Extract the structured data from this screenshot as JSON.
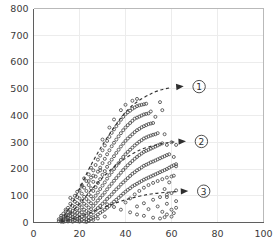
{
  "chart_data": {
    "type": "scatter",
    "title": "",
    "xlabel": "",
    "ylabel": "",
    "xlim": [
      0,
      100
    ],
    "ylim": [
      0,
      800
    ],
    "grid": true,
    "legend_position": "none",
    "xticks": [
      0,
      20,
      40,
      60,
      80,
      100
    ],
    "yticks": [
      0,
      100,
      200,
      300,
      400,
      500,
      600,
      700,
      800
    ],
    "xtick_labels": [
      "0",
      "20",
      "40",
      "60",
      "80",
      "100"
    ],
    "ytick_labels": [
      "0",
      "100",
      "200",
      "300",
      "400",
      "500",
      "600",
      "700",
      "800"
    ],
    "marker": "open-circle",
    "marker_color": "#4a4a4a",
    "points": [
      [
        11,
        5
      ],
      [
        11,
        12
      ],
      [
        12,
        3
      ],
      [
        12,
        8
      ],
      [
        12,
        18
      ],
      [
        12,
        25
      ],
      [
        13,
        2
      ],
      [
        13,
        10
      ],
      [
        13,
        15
      ],
      [
        13,
        22
      ],
      [
        13,
        33
      ],
      [
        14,
        5
      ],
      [
        14,
        12
      ],
      [
        14,
        20
      ],
      [
        14,
        28
      ],
      [
        14,
        42
      ],
      [
        15,
        4
      ],
      [
        15,
        9
      ],
      [
        15,
        17
      ],
      [
        15,
        26
      ],
      [
        15,
        38
      ],
      [
        15,
        55
      ],
      [
        16,
        6
      ],
      [
        16,
        14
      ],
      [
        16,
        24
      ],
      [
        16,
        35
      ],
      [
        16,
        48
      ],
      [
        16,
        70
      ],
      [
        17,
        3
      ],
      [
        17,
        11
      ],
      [
        17,
        21
      ],
      [
        17,
        30
      ],
      [
        17,
        44
      ],
      [
        17,
        62
      ],
      [
        17,
        85
      ],
      [
        18,
        8
      ],
      [
        18,
        16
      ],
      [
        18,
        27
      ],
      [
        18,
        40
      ],
      [
        18,
        58
      ],
      [
        18,
        78
      ],
      [
        18,
        100
      ],
      [
        19,
        5
      ],
      [
        19,
        13
      ],
      [
        19,
        23
      ],
      [
        19,
        36
      ],
      [
        19,
        52
      ],
      [
        19,
        72
      ],
      [
        19,
        95
      ],
      [
        20,
        7
      ],
      [
        20,
        18
      ],
      [
        20,
        31
      ],
      [
        20,
        46
      ],
      [
        20,
        66
      ],
      [
        20,
        90
      ],
      [
        20,
        120
      ],
      [
        21,
        10
      ],
      [
        21,
        22
      ],
      [
        21,
        38
      ],
      [
        21,
        57
      ],
      [
        21,
        80
      ],
      [
        21,
        108
      ],
      [
        21,
        140
      ],
      [
        22,
        4
      ],
      [
        22,
        15
      ],
      [
        22,
        29
      ],
      [
        22,
        48
      ],
      [
        22,
        70
      ],
      [
        22,
        96
      ],
      [
        22,
        130
      ],
      [
        22,
        165
      ],
      [
        23,
        12
      ],
      [
        23,
        26
      ],
      [
        23,
        43
      ],
      [
        23,
        64
      ],
      [
        23,
        88
      ],
      [
        23,
        118
      ],
      [
        23,
        155
      ],
      [
        24,
        9
      ],
      [
        24,
        20
      ],
      [
        24,
        36
      ],
      [
        24,
        56
      ],
      [
        24,
        79
      ],
      [
        24,
        105
      ],
      [
        24,
        140
      ],
      [
        24,
        180
      ],
      [
        25,
        14
      ],
      [
        25,
        30
      ],
      [
        25,
        50
      ],
      [
        25,
        72
      ],
      [
        25,
        98
      ],
      [
        25,
        128
      ],
      [
        25,
        168
      ],
      [
        25,
        205
      ],
      [
        26,
        18
      ],
      [
        26,
        38
      ],
      [
        26,
        62
      ],
      [
        26,
        88
      ],
      [
        26,
        118
      ],
      [
        26,
        152
      ],
      [
        26,
        195
      ],
      [
        27,
        24
      ],
      [
        27,
        46
      ],
      [
        27,
        72
      ],
      [
        27,
        100
      ],
      [
        27,
        132
      ],
      [
        27,
        172
      ],
      [
        27,
        215
      ],
      [
        28,
        30
      ],
      [
        28,
        54
      ],
      [
        28,
        82
      ],
      [
        28,
        112
      ],
      [
        28,
        148
      ],
      [
        28,
        190
      ],
      [
        28,
        235
      ],
      [
        29,
        36
      ],
      [
        29,
        62
      ],
      [
        29,
        92
      ],
      [
        29,
        125
      ],
      [
        29,
        162
      ],
      [
        29,
        205
      ],
      [
        29,
        250
      ],
      [
        30,
        42
      ],
      [
        30,
        70
      ],
      [
        30,
        102
      ],
      [
        30,
        138
      ],
      [
        30,
        178
      ],
      [
        30,
        222
      ],
      [
        30,
        270
      ],
      [
        30,
        310
      ],
      [
        31,
        48
      ],
      [
        31,
        78
      ],
      [
        31,
        112
      ],
      [
        31,
        150
      ],
      [
        31,
        192
      ],
      [
        31,
        238
      ],
      [
        31,
        288
      ],
      [
        32,
        55
      ],
      [
        32,
        88
      ],
      [
        32,
        124
      ],
      [
        32,
        164
      ],
      [
        32,
        208
      ],
      [
        32,
        255
      ],
      [
        32,
        305
      ],
      [
        33,
        62
      ],
      [
        33,
        96
      ],
      [
        33,
        135
      ],
      [
        33,
        177
      ],
      [
        33,
        222
      ],
      [
        33,
        270
      ],
      [
        33,
        320
      ],
      [
        33,
        355
      ],
      [
        34,
        70
      ],
      [
        34,
        105
      ],
      [
        34,
        145
      ],
      [
        34,
        188
      ],
      [
        34,
        235
      ],
      [
        34,
        285
      ],
      [
        34,
        335
      ],
      [
        35,
        78
      ],
      [
        35,
        115
      ],
      [
        35,
        156
      ],
      [
        35,
        200
      ],
      [
        35,
        248
      ],
      [
        35,
        298
      ],
      [
        35,
        348
      ],
      [
        35,
        385
      ],
      [
        36,
        85
      ],
      [
        36,
        124
      ],
      [
        36,
        166
      ],
      [
        36,
        212
      ],
      [
        36,
        260
      ],
      [
        36,
        310
      ],
      [
        36,
        360
      ],
      [
        37,
        92
      ],
      [
        37,
        132
      ],
      [
        37,
        176
      ],
      [
        37,
        222
      ],
      [
        37,
        272
      ],
      [
        37,
        322
      ],
      [
        37,
        372
      ],
      [
        38,
        100
      ],
      [
        38,
        142
      ],
      [
        38,
        186
      ],
      [
        38,
        234
      ],
      [
        38,
        284
      ],
      [
        38,
        334
      ],
      [
        38,
        384
      ],
      [
        38,
        420
      ],
      [
        39,
        108
      ],
      [
        39,
        150
      ],
      [
        39,
        196
      ],
      [
        39,
        245
      ],
      [
        39,
        295
      ],
      [
        39,
        345
      ],
      [
        39,
        395
      ],
      [
        40,
        115
      ],
      [
        40,
        158
      ],
      [
        40,
        205
      ],
      [
        40,
        255
      ],
      [
        40,
        305
      ],
      [
        40,
        355
      ],
      [
        40,
        405
      ],
      [
        40,
        440
      ],
      [
        41,
        122
      ],
      [
        41,
        166
      ],
      [
        41,
        214
      ],
      [
        41,
        264
      ],
      [
        41,
        314
      ],
      [
        41,
        364
      ],
      [
        41,
        412
      ],
      [
        42,
        128
      ],
      [
        42,
        174
      ],
      [
        42,
        222
      ],
      [
        42,
        272
      ],
      [
        42,
        322
      ],
      [
        42,
        372
      ],
      [
        42,
        418
      ],
      [
        43,
        135
      ],
      [
        43,
        182
      ],
      [
        43,
        230
      ],
      [
        43,
        280
      ],
      [
        43,
        330
      ],
      [
        43,
        380
      ],
      [
        43,
        425
      ],
      [
        43,
        455
      ],
      [
        44,
        140
      ],
      [
        44,
        188
      ],
      [
        44,
        238
      ],
      [
        44,
        288
      ],
      [
        44,
        338
      ],
      [
        44,
        388
      ],
      [
        44,
        430
      ],
      [
        45,
        145
      ],
      [
        45,
        195
      ],
      [
        45,
        245
      ],
      [
        45,
        295
      ],
      [
        45,
        345
      ],
      [
        45,
        392
      ],
      [
        45,
        435
      ],
      [
        45,
        462
      ],
      [
        46,
        150
      ],
      [
        46,
        200
      ],
      [
        46,
        252
      ],
      [
        46,
        302
      ],
      [
        46,
        350
      ],
      [
        46,
        396
      ],
      [
        46,
        438
      ],
      [
        47,
        155
      ],
      [
        47,
        206
      ],
      [
        47,
        258
      ],
      [
        47,
        308
      ],
      [
        47,
        356
      ],
      [
        47,
        400
      ],
      [
        47,
        440
      ],
      [
        48,
        160
      ],
      [
        48,
        212
      ],
      [
        48,
        264
      ],
      [
        48,
        314
      ],
      [
        48,
        360
      ],
      [
        48,
        404
      ],
      [
        48,
        442
      ],
      [
        49,
        164
      ],
      [
        49,
        216
      ],
      [
        49,
        268
      ],
      [
        49,
        318
      ],
      [
        49,
        364
      ],
      [
        49,
        406
      ],
      [
        49,
        444
      ],
      [
        50,
        168
      ],
      [
        50,
        220
      ],
      [
        50,
        272
      ],
      [
        50,
        322
      ],
      [
        50,
        368
      ],
      [
        50,
        408
      ],
      [
        51,
        172
      ],
      [
        51,
        225
      ],
      [
        51,
        276
      ],
      [
        51,
        325
      ],
      [
        51,
        370
      ],
      [
        52,
        176
      ],
      [
        52,
        228
      ],
      [
        52,
        280
      ],
      [
        52,
        328
      ],
      [
        52,
        372
      ],
      [
        53,
        180
      ],
      [
        53,
        232
      ],
      [
        53,
        284
      ],
      [
        53,
        330
      ],
      [
        54,
        184
      ],
      [
        54,
        236
      ],
      [
        54,
        288
      ],
      [
        54,
        334
      ],
      [
        55,
        188
      ],
      [
        55,
        240
      ],
      [
        55,
        292
      ],
      [
        56,
        192
      ],
      [
        56,
        244
      ],
      [
        56,
        296
      ],
      [
        57,
        196
      ],
      [
        57,
        248
      ],
      [
        58,
        200
      ],
      [
        58,
        252
      ],
      [
        59,
        205
      ],
      [
        60,
        210
      ],
      [
        61,
        214
      ],
      [
        62,
        218
      ],
      [
        40,
        75
      ],
      [
        42,
        90
      ],
      [
        44,
        105
      ],
      [
        46,
        118
      ],
      [
        48,
        130
      ],
      [
        50,
        140
      ],
      [
        52,
        148
      ],
      [
        54,
        155
      ],
      [
        56,
        162
      ],
      [
        58,
        168
      ],
      [
        60,
        172
      ],
      [
        45,
        60
      ],
      [
        48,
        72
      ],
      [
        52,
        85
      ],
      [
        55,
        95
      ],
      [
        58,
        104
      ],
      [
        50,
        50
      ],
      [
        54,
        60
      ],
      [
        58,
        70
      ],
      [
        62,
        80
      ],
      [
        56,
        40
      ],
      [
        60,
        48
      ],
      [
        62,
        55
      ],
      [
        58,
        30
      ],
      [
        61,
        35
      ],
      [
        57,
        20
      ],
      [
        60,
        22
      ],
      [
        55,
        15
      ],
      [
        52,
        18
      ],
      [
        48,
        25
      ],
      [
        45,
        30
      ],
      [
        42,
        38
      ],
      [
        38,
        48
      ],
      [
        35,
        58
      ],
      [
        32,
        68
      ],
      [
        28,
        15
      ],
      [
        31,
        22
      ],
      [
        26,
        10
      ],
      [
        24,
        6
      ],
      [
        20,
        3
      ],
      [
        23,
        2
      ],
      [
        14,
        48
      ],
      [
        16,
        92
      ],
      [
        19,
        115
      ],
      [
        21,
        135
      ],
      [
        24,
        155
      ],
      [
        26,
        175
      ],
      [
        29,
        195
      ],
      [
        57,
        330
      ],
      [
        58,
        290
      ],
      [
        59,
        255
      ],
      [
        60,
        300
      ],
      [
        61,
        245
      ],
      [
        56,
        420
      ],
      [
        55,
        450
      ],
      [
        53,
        395
      ],
      [
        51,
        415
      ],
      [
        62,
        290
      ],
      [
        62,
        210
      ],
      [
        61,
        175
      ],
      [
        59,
        150
      ],
      [
        57,
        125
      ],
      [
        62,
        120
      ],
      [
        60,
        110
      ],
      [
        58,
        95
      ]
    ],
    "trends": [
      {
        "id": "trend-1",
        "label": "1",
        "label_display": "①",
        "path_points": [
          [
            12,
            6
          ],
          [
            18,
            90
          ],
          [
            25,
            215
          ],
          [
            33,
            330
          ],
          [
            42,
            430
          ],
          [
            52,
            485
          ],
          [
            60,
            505
          ]
        ],
        "arrow_at": [
          64,
          508
        ]
      },
      {
        "id": "trend-2",
        "label": "2",
        "label_display": "②",
        "path_points": [
          [
            12,
            4
          ],
          [
            19,
            60
          ],
          [
            27,
            140
          ],
          [
            36,
            215
          ],
          [
            46,
            270
          ],
          [
            56,
            295
          ],
          [
            62,
            302
          ]
        ],
        "arrow_at": [
          65,
          303
        ]
      },
      {
        "id": "trend-3",
        "label": "3",
        "label_display": "③",
        "path_points": [
          [
            12,
            2
          ],
          [
            20,
            22
          ],
          [
            30,
            55
          ],
          [
            40,
            85
          ],
          [
            50,
            105
          ],
          [
            58,
            113
          ],
          [
            63,
            116
          ]
        ],
        "arrow_at": [
          66,
          117
        ]
      }
    ],
    "annotations": [
      {
        "text": "①",
        "x": 72,
        "y": 508
      },
      {
        "text": "②",
        "x": 73,
        "y": 303
      },
      {
        "text": "③",
        "x": 74,
        "y": 117
      }
    ]
  }
}
